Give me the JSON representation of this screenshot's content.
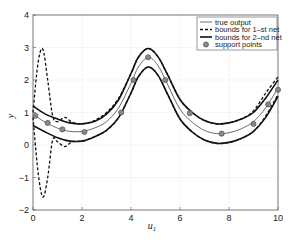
{
  "chart_data": {
    "type": "line",
    "title": "",
    "xlabel": "u1",
    "xlabel_main": "u",
    "xlabel_sub": "1",
    "ylabel": "y",
    "xlim": [
      0,
      10
    ],
    "ylim": [
      -2,
      4
    ],
    "xticks": [
      0,
      2,
      4,
      6,
      8,
      10
    ],
    "yticks": [
      -2,
      -1,
      0,
      1,
      2,
      3,
      4
    ],
    "xtick_labels": [
      "0",
      "2",
      "4",
      "6",
      "8",
      "10"
    ],
    "ytick_labels": [
      "−2",
      "−1",
      "0",
      "1",
      "2",
      "3",
      "4"
    ],
    "grid": true,
    "legend_position": "upper right",
    "legend": [
      {
        "label": "true output",
        "style": "thin-solid"
      },
      {
        "label": "bounds for 1–st net",
        "style": "dashed"
      },
      {
        "label": "bounds for 2–nd net",
        "style": "thick-solid"
      },
      {
        "label": "support points",
        "style": "marker"
      }
    ],
    "series": [
      {
        "name": "true output",
        "x": [
          0,
          0.5,
          1,
          1.5,
          2,
          2.5,
          3,
          3.5,
          4,
          4.3,
          4.7,
          5.1,
          5.5,
          6,
          6.5,
          7,
          7.5,
          8,
          8.5,
          9,
          9.5,
          10
        ],
        "y": [
          0.95,
          0.7,
          0.52,
          0.42,
          0.42,
          0.52,
          0.72,
          1.15,
          1.9,
          2.4,
          2.7,
          2.45,
          1.85,
          1.1,
          0.7,
          0.45,
          0.35,
          0.38,
          0.5,
          0.72,
          1.15,
          1.75
        ]
      },
      {
        "name": "bounds for 2-nd net (upper)",
        "x": [
          0,
          0.5,
          1,
          1.5,
          2,
          2.5,
          3,
          3.5,
          4,
          4.3,
          4.7,
          5.1,
          5.5,
          6,
          6.5,
          7,
          7.5,
          8,
          8.5,
          9,
          9.5,
          10
        ],
        "y": [
          1.2,
          0.95,
          0.8,
          0.68,
          0.65,
          0.72,
          0.95,
          1.4,
          2.2,
          2.7,
          2.97,
          2.72,
          2.15,
          1.4,
          1.0,
          0.75,
          0.65,
          0.68,
          0.8,
          1.0,
          1.45,
          2.0
        ]
      },
      {
        "name": "bounds for 2-nd net (lower)",
        "x": [
          0,
          0.5,
          1,
          1.5,
          2,
          2.5,
          3,
          3.5,
          4,
          4.3,
          4.7,
          5.1,
          5.5,
          6,
          6.5,
          7,
          7.5,
          8,
          8.5,
          9,
          9.5,
          10
        ],
        "y": [
          0.6,
          0.4,
          0.22,
          0.12,
          0.12,
          0.25,
          0.45,
          0.85,
          1.6,
          2.1,
          2.4,
          2.15,
          1.55,
          0.8,
          0.4,
          0.15,
          0.05,
          0.08,
          0.2,
          0.42,
          0.85,
          1.5
        ]
      },
      {
        "name": "bounds for 1-st net (upper)",
        "x": [
          0,
          0.2,
          0.4,
          0.6,
          0.8,
          1.0,
          1.3,
          1.6,
          2,
          2.5,
          3,
          3.5,
          4,
          4.3,
          4.7,
          5.1,
          5.5,
          6,
          6.5,
          7,
          7.5,
          8,
          8.5,
          9,
          9.5,
          10
        ],
        "y": [
          1.0,
          2.5,
          2.95,
          2.0,
          0.9,
          0.72,
          0.85,
          0.7,
          0.65,
          0.75,
          1.0,
          1.45,
          2.2,
          2.7,
          2.97,
          2.72,
          2.15,
          1.4,
          1.0,
          0.75,
          0.65,
          0.68,
          0.8,
          1.05,
          1.6,
          2.1
        ]
      },
      {
        "name": "bounds for 1-st net (lower)",
        "x": [
          0,
          0.2,
          0.4,
          0.6,
          0.8,
          1.0,
          1.3,
          1.6,
          2,
          2.5,
          3,
          3.5,
          4,
          4.3,
          4.7,
          5.1,
          5.5,
          6,
          6.5,
          7,
          7.5,
          8,
          8.5,
          9,
          9.5,
          10
        ],
        "y": [
          0.85,
          -0.8,
          -1.6,
          -1.0,
          0.15,
          0.1,
          -0.05,
          0.1,
          0.12,
          0.25,
          0.45,
          0.85,
          1.6,
          2.1,
          2.4,
          2.15,
          1.55,
          0.8,
          0.4,
          0.15,
          0.05,
          0.08,
          0.2,
          0.42,
          0.9,
          1.55
        ]
      },
      {
        "name": "support points",
        "x": [
          0.1,
          0.6,
          1.2,
          2.1,
          3.6,
          4.1,
          4.7,
          5.4,
          6.4,
          7.7,
          9.0,
          9.6,
          10.0
        ],
        "y": [
          0.9,
          0.68,
          0.48,
          0.4,
          1.0,
          2.0,
          2.7,
          2.0,
          0.98,
          0.35,
          0.65,
          1.25,
          1.7
        ]
      }
    ]
  }
}
